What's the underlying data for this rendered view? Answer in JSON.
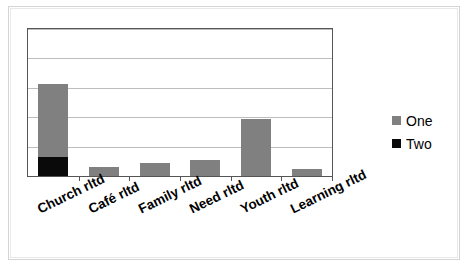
{
  "chart_data": {
    "type": "bar",
    "title": "",
    "subtitle": "",
    "xlabel": "",
    "ylabel": "",
    "stacked": true,
    "grid": true,
    "legend_position": "right",
    "ylim": [
      0,
      5
    ],
    "y_tick_values": [
      0,
      1,
      2,
      3,
      4,
      5
    ],
    "y_tick_labels_visible": false,
    "gridline_count": 5,
    "categories": [
      "Church rltd",
      "Café rltd",
      "Family rltd",
      "Need rltd",
      "Youth rltd",
      "Learning rltd"
    ],
    "series": [
      {
        "name": "One",
        "color": "#808080",
        "values": [
          2.5,
          0.3,
          0.44,
          0.54,
          1.95,
          0.24
        ]
      },
      {
        "name": "Two",
        "color": "#0a0a0a",
        "values": [
          0.64,
          0,
          0,
          0,
          0,
          0
        ]
      }
    ],
    "totals": [
      3.14,
      0.3,
      0.44,
      0.54,
      1.95,
      0.24
    ]
  },
  "legend": {
    "items": [
      {
        "label": "One",
        "color": "#808080"
      },
      {
        "label": "Two",
        "color": "#0a0a0a"
      }
    ]
  },
  "style": {
    "plot_border_color": "#555555",
    "gridline_color": "#bdbdbd",
    "frame_color": "#d4d4d4",
    "background": "#ffffff"
  }
}
